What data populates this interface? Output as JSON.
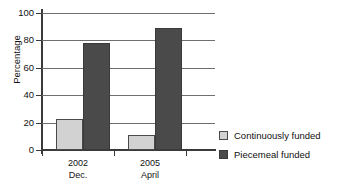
{
  "chart_data": {
    "type": "bar",
    "title": "",
    "xlabel": "",
    "ylabel": "Percentage",
    "ylim": [
      0,
      100
    ],
    "yticks": [
      0,
      20,
      40,
      60,
      80,
      100
    ],
    "grid": true,
    "legend_position": "right",
    "categories": [
      "2002\nDec.",
      "2005\nApril"
    ],
    "category_lines": [
      {
        "line1": "2002",
        "line2": "Dec."
      },
      {
        "line1": "2005",
        "line2": "April"
      }
    ],
    "series": [
      {
        "name": "Continuously funded",
        "color": "#d2d2d2",
        "values": [
          23,
          11
        ]
      },
      {
        "name": "Piecemeal funded",
        "color": "#4a4a4a",
        "values": [
          78,
          89
        ]
      }
    ]
  },
  "axis": {
    "y_title": "Percentage",
    "y_tick_labels": [
      "100",
      "80",
      "60",
      "40",
      "20",
      "0"
    ]
  },
  "legend": {
    "items": [
      {
        "label": "Continuously funded",
        "swatch": "light-gray-square"
      },
      {
        "label": "Piecemeal funded",
        "swatch": "dark-gray-square"
      }
    ]
  }
}
